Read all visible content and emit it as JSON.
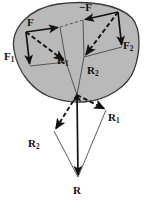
{
  "figure": {
    "type": "physics-vector-diagram",
    "background_color": "#ffffff",
    "body_fill_color": "#b9b9b9",
    "body_stroke_color": "#3a3a3a",
    "vector_color": "#111111",
    "thin_line_color": "#555555"
  },
  "labels": {
    "F": {
      "base": "F",
      "sub": "",
      "x": 27,
      "y": 18
    },
    "minusF": {
      "base": "−F",
      "sub": "",
      "x": 79,
      "y": 4
    },
    "F1": {
      "base": "F",
      "sub": "1",
      "x": 5,
      "y": 52
    },
    "F2": {
      "base": "F",
      "sub": "2",
      "x": 122,
      "y": 42
    },
    "R1_top": {
      "base": "R",
      "sub": "1",
      "x": 56,
      "y": 56
    },
    "R2_top": {
      "base": "R",
      "sub": "2",
      "x": 87,
      "y": 66
    },
    "R1_bottom": {
      "base": "R",
      "sub": "1",
      "x": 108,
      "y": 113
    },
    "R2_bottom": {
      "base": "R",
      "sub": "2",
      "x": 29,
      "y": 139
    },
    "R_resultant": {
      "base": "R",
      "sub": "",
      "x": 73,
      "y": 186
    }
  },
  "vectors": [
    {
      "name": "F",
      "style": "solid",
      "from": [
        26,
        32
      ],
      "to": [
        60,
        27
      ]
    },
    {
      "name": "F1",
      "style": "solid",
      "from": [
        26,
        32
      ],
      "to": [
        30,
        66
      ]
    },
    {
      "name": "R1-top",
      "style": "dashed",
      "from": [
        26,
        32
      ],
      "to": [
        66,
        62
      ]
    },
    {
      "name": "-F",
      "style": "solid",
      "from": [
        118,
        12
      ],
      "to": [
        83,
        20
      ]
    },
    {
      "name": "F2",
      "style": "solid",
      "from": [
        118,
        12
      ],
      "to": [
        122,
        47
      ]
    },
    {
      "name": "R2-top",
      "style": "dashed",
      "from": [
        118,
        12
      ],
      "to": [
        84,
        57
      ]
    },
    {
      "name": "R1-bottom",
      "style": "dashed",
      "from": [
        77,
        95
      ],
      "to": [
        106,
        110
      ]
    },
    {
      "name": "R2-bottom",
      "style": "dashed",
      "from": [
        77,
        95
      ],
      "to": [
        54,
        131
      ]
    },
    {
      "name": "R-resultant",
      "style": "solid",
      "from": [
        77,
        95
      ],
      "to": [
        78,
        177
      ]
    }
  ],
  "construction_lines": [
    {
      "name": "parallelogram-left-bottom",
      "points": [
        [
          30,
          66
        ],
        [
          66,
          62
        ]
      ]
    },
    {
      "name": "parallelogram-left-right",
      "points": [
        [
          60,
          27
        ],
        [
          66,
          62
        ]
      ]
    },
    {
      "name": "parallelogram-right-bottom",
      "points": [
        [
          84,
          57
        ],
        [
          122,
          47
        ]
      ]
    },
    {
      "name": "parallelogram-right-left",
      "points": [
        [
          83,
          20
        ],
        [
          84,
          57
        ]
      ]
    },
    {
      "name": "transfer-line-F-to-minusF",
      "points": [
        [
          60,
          27
        ],
        [
          83,
          20
        ]
      ]
    },
    {
      "name": "R1-tip-to-convergence",
      "points": [
        [
          66,
          62
        ],
        [
          77,
          95
        ]
      ]
    },
    {
      "name": "R2-tip-to-convergence",
      "points": [
        [
          84,
          57
        ],
        [
          77,
          95
        ]
      ]
    },
    {
      "name": "lower-triangle-right",
      "points": [
        [
          106,
          110
        ],
        [
          78,
          177
        ]
      ]
    },
    {
      "name": "lower-triangle-left",
      "points": [
        [
          54,
          131
        ],
        [
          78,
          177
        ]
      ]
    }
  ],
  "body_outline": {
    "name": "rigid-body-blob",
    "path": "M 14 50 C 10 28 30 8 58 4 C 88 0 118 4 132 18 C 142 30 140 54 134 70 C 128 86 108 100 84 102 C 70 103 58 100 48 96 C 34 90 18 74 14 50 Z"
  }
}
